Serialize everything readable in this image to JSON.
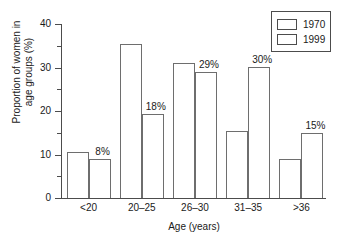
{
  "chart_data": {
    "type": "bar",
    "title": "",
    "xlabel": "Age (years)",
    "ylabel": "Proportion of women in age groups (%)",
    "ylabel_line1": "Proportion of women in",
    "ylabel_line2": "age groups (%)",
    "categories": [
      "<20",
      "20–25",
      "26–30",
      "31–35",
      ">36"
    ],
    "ylim": [
      0,
      40
    ],
    "ytick_labels": [
      "0",
      "10",
      "20",
      "30",
      "40"
    ],
    "ytick_values": [
      0,
      10,
      20,
      30,
      40
    ],
    "yminor_values": [
      5,
      15,
      25,
      35
    ],
    "grid": false,
    "legend_position": "top-right",
    "series": [
      {
        "name": "1970",
        "values": [
          10.5,
          35.5,
          31.0,
          15.5,
          9.0
        ],
        "data_labels": [
          "",
          "",
          "",
          "",
          ""
        ]
      },
      {
        "name": "1999",
        "values": [
          9.0,
          19.3,
          29.0,
          30.2,
          15.0
        ],
        "data_labels": [
          "8%",
          "18%",
          "29%",
          "30%",
          "15%"
        ]
      }
    ]
  },
  "legend": {
    "items": [
      {
        "label": "1970"
      },
      {
        "label": "1999"
      }
    ]
  }
}
